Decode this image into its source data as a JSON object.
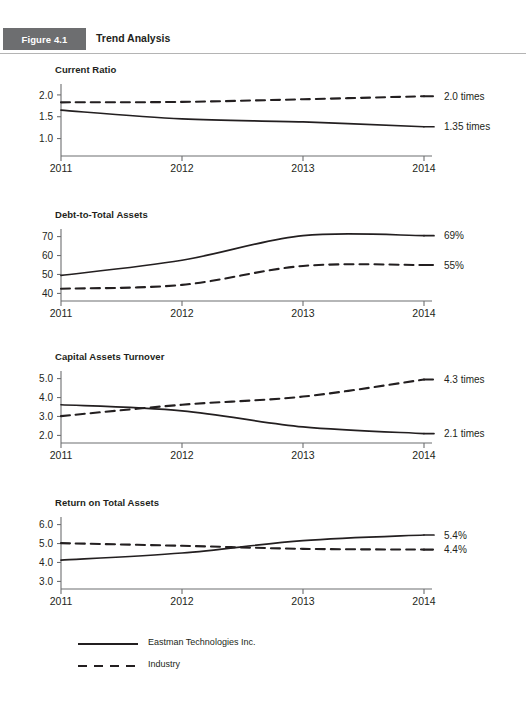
{
  "header": {
    "figure_tag": "Figure 4.1",
    "title": "Trend Analysis",
    "tag_bg": "#6d6e70",
    "tag_text_color": "#ffffff",
    "rule_color": "#b4b4b4"
  },
  "legend": {
    "items": [
      {
        "label": "Eastman Technologies Inc.",
        "style": "solid",
        "name": "legend-company"
      },
      {
        "label": "Industry",
        "style": "dashed",
        "name": "legend-industry"
      }
    ]
  },
  "chart_data": [
    {
      "type": "line",
      "title": "Current Ratio",
      "xlabel": "",
      "ylabel": "",
      "x": [
        "2011",
        "2012",
        "2013",
        "2014"
      ],
      "yticks": [
        "2.0",
        "1.5",
        "1.0"
      ],
      "ytick_values": [
        2.0,
        1.5,
        1.0
      ],
      "ylim": [
        0.6,
        2.25
      ],
      "grid": false,
      "legend_position": "bottom",
      "series": [
        {
          "name": "Eastman Technologies Inc.",
          "style": "solid",
          "values": [
            1.65,
            1.45,
            1.38,
            1.27
          ],
          "end_label": "1.35 times"
        },
        {
          "name": "Industry",
          "style": "dashed",
          "values": [
            1.83,
            1.84,
            1.9,
            1.97
          ],
          "end_label": "2.0 times"
        }
      ]
    },
    {
      "type": "line",
      "title": "Debt-to-Total Assets",
      "xlabel": "",
      "ylabel": "",
      "x": [
        "2011",
        "2012",
        "2013",
        "2014"
      ],
      "yticks": [
        "70",
        "60",
        "50",
        "40"
      ],
      "ytick_values": [
        70,
        60,
        50,
        40
      ],
      "ylim": [
        36,
        74
      ],
      "grid": false,
      "legend_position": "bottom",
      "series": [
        {
          "name": "Eastman Technologies Inc.",
          "style": "solid",
          "values": [
            49.5,
            57.5,
            70.5,
            70.5
          ],
          "end_label": "69%"
        },
        {
          "name": "Industry",
          "style": "dashed",
          "values": [
            42.5,
            44.5,
            54.5,
            55.0
          ],
          "end_label": "55%"
        }
      ]
    },
    {
      "type": "line",
      "title": "Capital Assets Turnover",
      "xlabel": "",
      "ylabel": "",
      "x": [
        "2011",
        "2012",
        "2013",
        "2014"
      ],
      "yticks": [
        "5.0",
        "4.0",
        "3.0",
        "2.0"
      ],
      "ytick_values": [
        5.0,
        4.0,
        3.0,
        2.0
      ],
      "ylim": [
        1.6,
        5.4
      ],
      "grid": false,
      "legend_position": "bottom",
      "series": [
        {
          "name": "Eastman Technologies Inc.",
          "style": "solid",
          "values": [
            3.62,
            3.3,
            2.45,
            2.1
          ],
          "end_label": "2.1 times"
        },
        {
          "name": "Industry",
          "style": "dashed",
          "values": [
            3.02,
            3.62,
            4.05,
            4.95
          ],
          "end_label": "4.3 times"
        }
      ]
    },
    {
      "type": "line",
      "title": "Return on Total Assets",
      "xlabel": "",
      "ylabel": "",
      "x": [
        "2011",
        "2012",
        "2013",
        "2014"
      ],
      "yticks": [
        "6.0",
        "5.0",
        "4.0",
        "3.0"
      ],
      "ytick_values": [
        6.0,
        5.0,
        4.0,
        3.0
      ],
      "ylim": [
        2.6,
        6.4
      ],
      "grid": false,
      "legend_position": "bottom",
      "series": [
        {
          "name": "Eastman Technologies Inc.",
          "style": "solid",
          "values": [
            4.12,
            4.5,
            5.15,
            5.45
          ],
          "end_label": "5.4%"
        },
        {
          "name": "Industry",
          "style": "dashed",
          "values": [
            5.02,
            4.88,
            4.72,
            4.68
          ],
          "end_label": "4.4%"
        }
      ]
    }
  ]
}
